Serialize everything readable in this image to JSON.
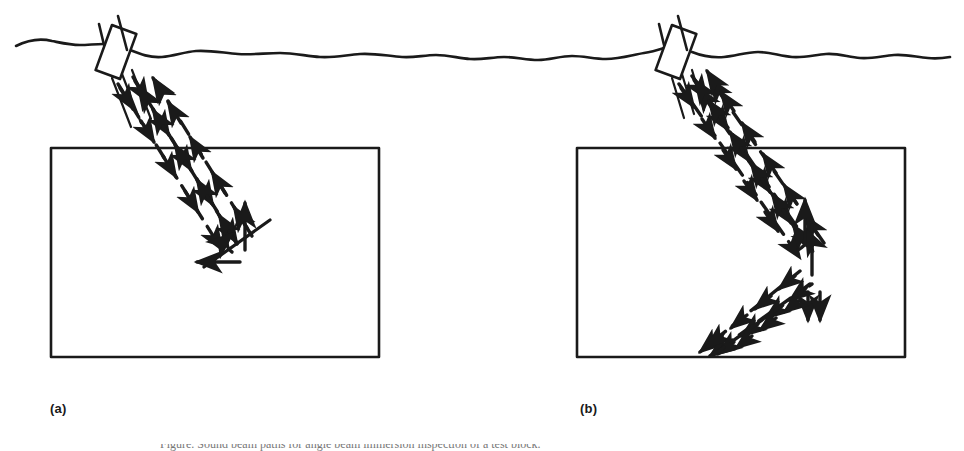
{
  "figure": {
    "background_color": "#ffffff",
    "ink_color": "#1a1a1a",
    "width": 964,
    "height": 451
  },
  "panels": [
    {
      "id": "a",
      "label": "(a)",
      "description": "Angled transducer directs a slanted sound beam through the water path into the test block; the beam strikes an inclined (about 45 degree) reflector and is reflected back toward the transducer and sideways.",
      "transducer": {
        "name": "immersion-transducer",
        "body": {
          "x": 103,
          "y": 28,
          "width": 26,
          "height": 48,
          "rotation_deg": 20
        },
        "cable_stems": 2
      },
      "water_surface": {
        "label": "water-surface-line",
        "y": 44
      },
      "test_block": {
        "x": 51,
        "y": 148,
        "width": 328,
        "height": 209
      },
      "reflector": {
        "name": "inclined-reflector",
        "x1": 205,
        "y1": 266,
        "x2": 268,
        "y2": 221,
        "orientation": "inclined-45-degrees"
      },
      "beams": [
        {
          "name": "incident-beam",
          "direction": "down-right",
          "arrow": "forward"
        },
        {
          "name": "reflected-beam",
          "direction": "up-left",
          "arrow": "backward"
        },
        {
          "name": "corner-return-arrow",
          "direction": "up",
          "arrow": "forward"
        },
        {
          "name": "lateral-return-arrow",
          "direction": "left",
          "arrow": "forward"
        }
      ]
    },
    {
      "id": "b",
      "label": "(b)",
      "description": "Transducer directs a steeper sound beam into the test block; the beam strikes a vertical reflector, deflects downward and travels down-left to the bottom surface of the block.",
      "transducer": {
        "name": "immersion-transducer",
        "body": {
          "x": 663,
          "y": 28,
          "width": 26,
          "height": 48,
          "rotation_deg": 20
        },
        "cable_stems": 2
      },
      "water_surface": {
        "label": "water-surface-line",
        "y": 44
      },
      "test_block": {
        "x": 577,
        "y": 148,
        "width": 328,
        "height": 209
      },
      "reflector": {
        "name": "vertical-reflector",
        "x1": 812,
        "y1": 226,
        "x2": 812,
        "y2": 274,
        "orientation": "vertical"
      },
      "beams": [
        {
          "name": "incident-beam",
          "direction": "down-right",
          "arrow": "forward"
        },
        {
          "name": "reflected-beam",
          "direction": "up-left",
          "arrow": "backward"
        },
        {
          "name": "deflected-beam",
          "direction": "down-left",
          "arrow": "forward"
        },
        {
          "name": "return-beam",
          "direction": "up-right",
          "arrow": "backward"
        },
        {
          "name": "corner-return-arrow",
          "direction": "up",
          "arrow": "forward"
        },
        {
          "name": "downward-pair-arrows",
          "direction": "down",
          "arrow": "forward"
        }
      ]
    }
  ],
  "caption": {
    "cutoff_text": "Figure. Sound beam paths for angle beam immersion inspection of a test block."
  }
}
